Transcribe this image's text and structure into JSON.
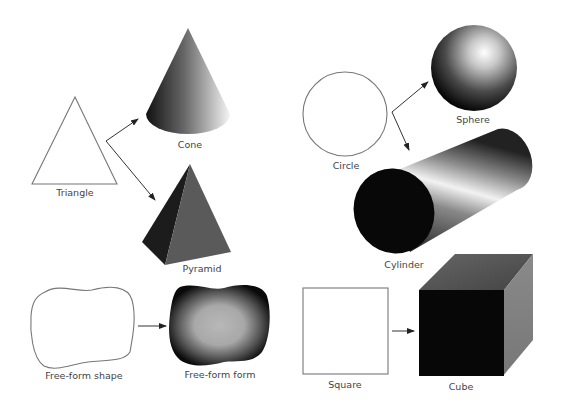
{
  "diagram": {
    "groups": [
      {
        "shape": "Triangle",
        "forms": [
          "Cone",
          "Pyramid"
        ]
      },
      {
        "shape": "Circle",
        "forms": [
          "Sphere",
          "Cylinder"
        ]
      },
      {
        "shape": "Free-form shape",
        "forms": [
          "Free-form form"
        ]
      },
      {
        "shape": "Square",
        "forms": [
          "Cube"
        ]
      }
    ],
    "labels": {
      "triangle": "Triangle",
      "cone": "Cone",
      "pyramid": "Pyramid",
      "circle": "Circle",
      "sphere": "Sphere",
      "cylinder": "Cylinder",
      "freeform_shape": "Free-form shape",
      "freeform_form": "Free-form form",
      "square": "Square",
      "cube": "Cube"
    }
  }
}
